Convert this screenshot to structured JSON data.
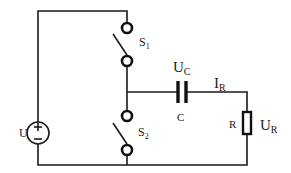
{
  "diagram": {
    "type": "circuit-schematic",
    "components": {
      "source": {
        "label": "U",
        "plus": "+",
        "minus": "–"
      },
      "switch1": {
        "label": "S",
        "sub": "1"
      },
      "switch2": {
        "label": "S",
        "sub": "2"
      },
      "capacitor": {
        "label": "C",
        "voltage_label": "U",
        "voltage_sub": "C"
      },
      "resistor": {
        "label": "R",
        "voltage_label": "U",
        "voltage_sub": "R"
      },
      "current": {
        "label": "I",
        "sub": "R"
      }
    },
    "colors": {
      "wire": "#1a1a1a",
      "background": "#ffffff"
    }
  }
}
